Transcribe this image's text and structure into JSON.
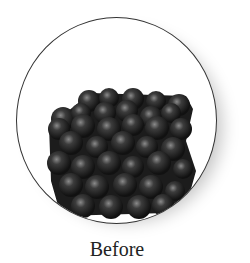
{
  "figure": {
    "caption": "Before",
    "colors": {
      "atom": "#2a2a2a",
      "atom_highlight": "#777777",
      "border": "#333333",
      "background": "#ffffff"
    }
  }
}
